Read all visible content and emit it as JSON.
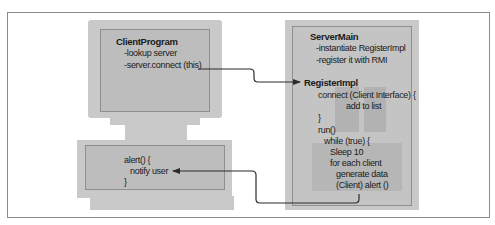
{
  "client": {
    "monitor": {
      "title": "ClientProgram",
      "lines": [
        "-lookup server",
        "-server.connect (this)"
      ]
    },
    "base": {
      "lines": [
        "alert() {",
        "notify user",
        "}"
      ]
    }
  },
  "server": {
    "title": "ServerMain",
    "lines": [
      "-instantiate RegisterImpl",
      "-register it with RMI"
    ],
    "impl_title": "RegisterImpl",
    "impl_lines": [
      "connect (Client Interface) {",
      "add to list",
      "}",
      "run()",
      "while (true) {",
      "Sleep 10",
      "for each client",
      "generate data",
      "(Client) alert ()"
    ]
  },
  "colors": {
    "box_fill": "#c9c9c9",
    "inner_fill": "#bdbdbd",
    "arrow": "#2b2b2b",
    "frame": "#8a8a8a"
  }
}
